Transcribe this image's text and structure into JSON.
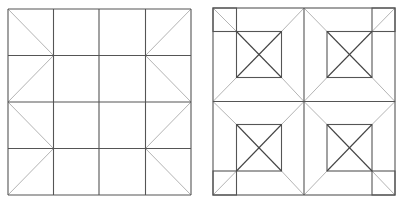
{
  "figures": [
    {
      "name": "left-pattern",
      "description": "4x4 grid with diagonals in outer columns",
      "box": {
        "x1": 8,
        "y1": 9,
        "x2": 191,
        "y2": 195
      },
      "grid_cols": [
        8,
        53.5,
        99,
        145.5,
        191
      ],
      "grid_rows": [
        9,
        55.5,
        102,
        148.5,
        195
      ],
      "diagonals": [
        [
          8,
          9,
          53.5,
          55.5
        ],
        [
          53.5,
          55.5,
          8,
          102
        ],
        [
          8,
          102,
          53.5,
          148.5
        ],
        [
          53.5,
          148.5,
          8,
          195
        ],
        [
          191,
          9,
          145.5,
          55.5
        ],
        [
          145.5,
          55.5,
          191,
          102
        ],
        [
          191,
          102,
          145.5,
          148.5
        ],
        [
          145.5,
          148.5,
          191,
          195
        ]
      ]
    },
    {
      "name": "right-pattern",
      "description": "2x2 quadrants each with inner crossed square and corner squares",
      "box": {
        "x1": 213,
        "y1": 8,
        "x2": 395,
        "y2": 195
      },
      "center": {
        "x": 304,
        "y": 101.5
      },
      "inner_squares": [
        {
          "x1": 236.5,
          "y1": 31.5,
          "x2": 281.5,
          "y2": 77.5
        },
        {
          "x1": 327,
          "y1": 31.5,
          "x2": 372,
          "y2": 77.5
        },
        {
          "x1": 236.5,
          "y1": 124.5,
          "x2": 281.5,
          "y2": 171
        },
        {
          "x1": 327,
          "y1": 124.5,
          "x2": 372,
          "y2": 171
        }
      ],
      "corner_squares": [
        {
          "x1": 213,
          "y1": 8,
          "x2": 236.5,
          "y2": 31.5
        },
        {
          "x1": 372,
          "y1": 8,
          "x2": 395,
          "y2": 31.5
        },
        {
          "x1": 213,
          "y1": 171,
          "x2": 236.5,
          "y2": 195
        },
        {
          "x1": 372,
          "y1": 171,
          "x2": 395,
          "y2": 195
        }
      ]
    }
  ],
  "colors": {
    "grid": "#555555",
    "diagonal_light": "#b4b4b4",
    "diagonal_dark": "#444444",
    "background": "#ffffff"
  }
}
